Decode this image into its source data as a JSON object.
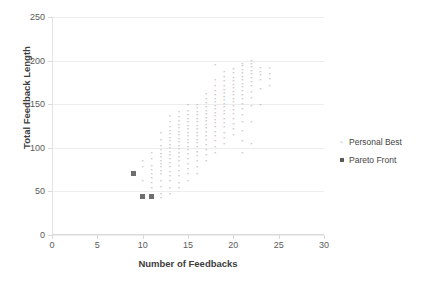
{
  "chart_data": {
    "type": "scatter",
    "title": "",
    "xlabel": "Number of Feedbacks",
    "ylabel": "Total Feedback Length",
    "xlim": [
      0,
      30
    ],
    "ylim": [
      0,
      250
    ],
    "xticks": [
      0,
      5,
      10,
      15,
      20,
      25,
      30
    ],
    "yticks": [
      0,
      50,
      100,
      150,
      200,
      250
    ],
    "grid": "horizontal",
    "legend_position": "right",
    "series": [
      {
        "name": "Personal Best",
        "marker": "x",
        "color": "#9b9b9b",
        "points": [
          [
            9,
            72
          ],
          [
            9,
            70
          ],
          [
            10,
            46
          ],
          [
            10,
            44
          ],
          [
            10,
            62
          ],
          [
            10,
            78
          ],
          [
            10,
            85
          ],
          [
            11,
            45
          ],
          [
            11,
            44
          ],
          [
            11,
            55
          ],
          [
            11,
            60
          ],
          [
            11,
            66
          ],
          [
            11,
            70
          ],
          [
            11,
            75
          ],
          [
            11,
            80
          ],
          [
            11,
            88
          ],
          [
            11,
            95
          ],
          [
            12,
            43
          ],
          [
            12,
            48
          ],
          [
            12,
            56
          ],
          [
            12,
            63
          ],
          [
            12,
            70
          ],
          [
            12,
            74
          ],
          [
            12,
            78
          ],
          [
            12,
            82
          ],
          [
            12,
            86
          ],
          [
            12,
            90
          ],
          [
            12,
            94
          ],
          [
            12,
            98
          ],
          [
            12,
            103
          ],
          [
            12,
            110
          ],
          [
            12,
            118
          ],
          [
            13,
            48
          ],
          [
            13,
            55
          ],
          [
            13,
            62
          ],
          [
            13,
            68
          ],
          [
            13,
            73
          ],
          [
            13,
            78
          ],
          [
            13,
            83
          ],
          [
            13,
            88
          ],
          [
            13,
            92
          ],
          [
            13,
            96
          ],
          [
            13,
            100
          ],
          [
            13,
            104
          ],
          [
            13,
            108
          ],
          [
            13,
            112
          ],
          [
            13,
            116
          ],
          [
            13,
            120
          ],
          [
            13,
            124
          ],
          [
            13,
            130
          ],
          [
            13,
            137
          ],
          [
            14,
            55
          ],
          [
            14,
            60
          ],
          [
            14,
            68
          ],
          [
            14,
            74
          ],
          [
            14,
            80
          ],
          [
            14,
            85
          ],
          [
            14,
            90
          ],
          [
            14,
            95
          ],
          [
            14,
            99
          ],
          [
            14,
            103
          ],
          [
            14,
            107
          ],
          [
            14,
            111
          ],
          [
            14,
            115
          ],
          [
            14,
            119
          ],
          [
            14,
            123
          ],
          [
            14,
            127
          ],
          [
            14,
            131
          ],
          [
            14,
            136
          ],
          [
            14,
            142
          ],
          [
            15,
            62
          ],
          [
            15,
            70
          ],
          [
            15,
            76
          ],
          [
            15,
            82
          ],
          [
            15,
            88
          ],
          [
            15,
            93
          ],
          [
            15,
            98
          ],
          [
            15,
            102
          ],
          [
            15,
            106
          ],
          [
            15,
            110
          ],
          [
            15,
            114
          ],
          [
            15,
            118
          ],
          [
            15,
            122
          ],
          [
            15,
            126
          ],
          [
            15,
            130
          ],
          [
            15,
            134
          ],
          [
            15,
            138
          ],
          [
            15,
            143
          ],
          [
            15,
            150
          ],
          [
            16,
            70
          ],
          [
            16,
            78
          ],
          [
            16,
            85
          ],
          [
            16,
            91
          ],
          [
            16,
            96
          ],
          [
            16,
            101
          ],
          [
            16,
            106
          ],
          [
            16,
            110
          ],
          [
            16,
            114
          ],
          [
            16,
            118
          ],
          [
            16,
            122
          ],
          [
            16,
            126
          ],
          [
            16,
            130
          ],
          [
            16,
            134
          ],
          [
            16,
            138
          ],
          [
            16,
            142
          ],
          [
            16,
            146
          ],
          [
            16,
            150
          ],
          [
            17,
            85
          ],
          [
            17,
            92
          ],
          [
            17,
            98
          ],
          [
            17,
            104
          ],
          [
            17,
            109
          ],
          [
            17,
            114
          ],
          [
            17,
            119
          ],
          [
            17,
            123
          ],
          [
            17,
            127
          ],
          [
            17,
            131
          ],
          [
            17,
            135
          ],
          [
            17,
            139
          ],
          [
            17,
            143
          ],
          [
            17,
            147
          ],
          [
            17,
            152
          ],
          [
            17,
            157
          ],
          [
            17,
            162
          ],
          [
            18,
            95
          ],
          [
            18,
            102
          ],
          [
            18,
            108
          ],
          [
            18,
            114
          ],
          [
            18,
            119
          ],
          [
            18,
            124
          ],
          [
            18,
            129
          ],
          [
            18,
            133
          ],
          [
            18,
            137
          ],
          [
            18,
            141
          ],
          [
            18,
            145
          ],
          [
            18,
            149
          ],
          [
            18,
            153
          ],
          [
            18,
            157
          ],
          [
            18,
            161
          ],
          [
            18,
            166
          ],
          [
            18,
            172
          ],
          [
            18,
            178
          ],
          [
            18,
            195
          ],
          [
            19,
            105
          ],
          [
            19,
            112
          ],
          [
            19,
            118
          ],
          [
            19,
            124
          ],
          [
            19,
            129
          ],
          [
            19,
            134
          ],
          [
            19,
            139
          ],
          [
            19,
            143
          ],
          [
            19,
            147
          ],
          [
            19,
            151
          ],
          [
            19,
            155
          ],
          [
            19,
            159
          ],
          [
            19,
            163
          ],
          [
            19,
            167
          ],
          [
            19,
            172
          ],
          [
            19,
            177
          ],
          [
            19,
            182
          ],
          [
            19,
            188
          ],
          [
            20,
            115
          ],
          [
            20,
            122
          ],
          [
            20,
            128
          ],
          [
            20,
            134
          ],
          [
            20,
            139
          ],
          [
            20,
            144
          ],
          [
            20,
            149
          ],
          [
            20,
            153
          ],
          [
            20,
            157
          ],
          [
            20,
            161
          ],
          [
            20,
            165
          ],
          [
            20,
            169
          ],
          [
            20,
            173
          ],
          [
            20,
            177
          ],
          [
            20,
            181
          ],
          [
            20,
            186
          ],
          [
            20,
            191
          ],
          [
            21,
            95
          ],
          [
            21,
            108
          ],
          [
            21,
            120
          ],
          [
            21,
            130
          ],
          [
            21,
            138
          ],
          [
            21,
            145
          ],
          [
            21,
            151
          ],
          [
            21,
            156
          ],
          [
            21,
            161
          ],
          [
            21,
            166
          ],
          [
            21,
            170
          ],
          [
            21,
            174
          ],
          [
            21,
            178
          ],
          [
            21,
            182
          ],
          [
            21,
            186
          ],
          [
            21,
            190
          ],
          [
            21,
            194
          ],
          [
            21,
            197
          ],
          [
            22,
            105
          ],
          [
            22,
            130
          ],
          [
            22,
            148
          ],
          [
            22,
            158
          ],
          [
            22,
            165
          ],
          [
            22,
            171
          ],
          [
            22,
            176
          ],
          [
            22,
            181
          ],
          [
            22,
            185
          ],
          [
            22,
            189
          ],
          [
            22,
            193
          ],
          [
            22,
            197
          ],
          [
            22,
            200
          ],
          [
            23,
            150
          ],
          [
            23,
            168
          ],
          [
            23,
            178
          ],
          [
            23,
            184
          ],
          [
            23,
            188
          ],
          [
            23,
            192
          ],
          [
            24,
            172
          ],
          [
            24,
            180
          ],
          [
            24,
            185
          ],
          [
            24,
            192
          ]
        ]
      },
      {
        "name": "Pareto Front",
        "marker": "square",
        "color": "#6e6e6e",
        "points": [
          [
            9,
            70
          ],
          [
            10,
            44
          ],
          [
            11,
            44
          ]
        ]
      }
    ]
  },
  "legend": {
    "items": [
      {
        "label": "Personal Best",
        "marker": "x-marker"
      },
      {
        "label": "Pareto Front",
        "marker": "square-marker"
      }
    ]
  },
  "axes": {
    "x_title": "Number of Feedbacks",
    "y_title": "Total Feedback Length"
  }
}
